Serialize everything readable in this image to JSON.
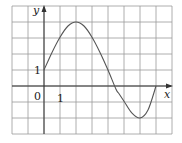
{
  "chart_data": {
    "type": "line",
    "title": "",
    "xlabel": "x",
    "ylabel": "y",
    "xlim": [
      -2,
      8
    ],
    "ylim": [
      -3,
      5
    ],
    "grid": true,
    "grid_step": 1,
    "tick_labels": {
      "origin": "0",
      "x": [
        {
          "value": 1,
          "label": "1"
        }
      ],
      "y": [
        {
          "value": 1,
          "label": "1"
        }
      ]
    },
    "series": [
      {
        "name": "f(x)",
        "x": [
          0,
          0.5,
          1,
          1.5,
          2,
          2.5,
          3,
          3.5,
          4,
          4.5,
          4.7,
          5,
          5.5,
          6,
          6.5,
          7
        ],
        "y": [
          1,
          2.1,
          3.05,
          3.75,
          4,
          3.75,
          3.05,
          2.1,
          1,
          -0.2,
          -0.5,
          -0.95,
          -1.7,
          -2,
          -1.5,
          0
        ]
      }
    ],
    "key_points": {
      "start": [
        0,
        1
      ],
      "maximum": [
        2,
        4
      ],
      "minimum": [
        6,
        -2
      ],
      "end": [
        7,
        0
      ]
    }
  },
  "labels": {
    "y_axis": "y",
    "x_axis": "x",
    "origin": "0",
    "x_tick_1": "1",
    "y_tick_1": "1"
  },
  "colors": {
    "grid": "#9a9a9a",
    "axis": "#333333",
    "curve": "#555555",
    "background": "#ffffff"
  }
}
